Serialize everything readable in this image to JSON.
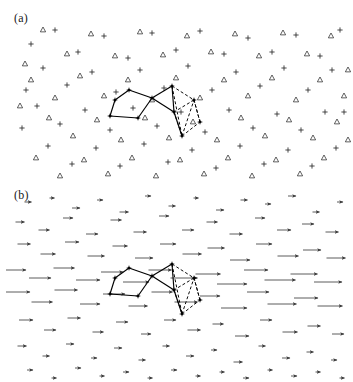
{
  "figure": {
    "type": "two-panel-scientific-figure",
    "width": 353,
    "height": 382,
    "background": "#ffffff"
  },
  "panels": [
    {
      "id": "a",
      "label": "(a)",
      "description": "Disordered two-dimensional particle lattice rendered with two alternating point-marker species (plus crosses and open upward triangles), overlaid by a bonded cluster: a solid pentagon on the left joined to a solid triangle, with dashed rhombus bonds on the right.",
      "marker_types": [
        "plus",
        "triangle"
      ],
      "marker_color": "#2b2b2b",
      "overlay_solid_color": "#000000",
      "overlay_dashed_color": "#000000",
      "n_markers": 120
    },
    {
      "id": "b",
      "label": "(b)",
      "description": "Same spatial domain shown as a displacement vector field: every lattice site carries a rightward-pointing arrow whose length encodes the local displacement magnitude, largest through the central horizontal band. The identical bonded cluster from panel (a) is overlaid.",
      "arrow_direction": "right",
      "arrow_color": "#4a4a4a",
      "arrowhead_color": "#3a3a3a",
      "n_arrows": 120
    }
  ],
  "chart_data": {
    "type": "scatter",
    "title": "",
    "subtitle": "",
    "xlabel": "",
    "ylabel": "",
    "grid": false,
    "legend_position": "none",
    "axis_visible": false,
    "tick_labels": [],
    "annotations": [
      "(a)",
      "(b)"
    ],
    "panel_a": {
      "type": "scatter",
      "series": [
        {
          "name": "plus-sites",
          "marker": "plus",
          "points": [
            [
              31,
              44
            ],
            [
              55,
              30
            ],
            [
              78,
              52
            ],
            [
              104,
              36
            ],
            [
              128,
              58
            ],
            [
              152,
              33
            ],
            [
              176,
              50
            ],
            [
              200,
              31
            ],
            [
              224,
              54
            ],
            [
              248,
              38
            ],
            [
              272,
              52
            ],
            [
              296,
              35
            ],
            [
              320,
              56
            ],
            [
              43,
              68
            ],
            [
              67,
              85
            ],
            [
              92,
              72
            ],
            [
              116,
              92
            ],
            [
              140,
              70
            ],
            [
              164,
              88
            ],
            [
              188,
              66
            ],
            [
              212,
              90
            ],
            [
              236,
              72
            ],
            [
              260,
              86
            ],
            [
              284,
              68
            ],
            [
              308,
              90
            ],
            [
              332,
              70
            ],
            [
              37,
              106
            ],
            [
              60,
              124
            ],
            [
              85,
              110
            ],
            [
              110,
              130
            ],
            [
              133,
              108
            ],
            [
              157,
              126
            ],
            [
              181,
              112
            ],
            [
              205,
              132
            ],
            [
              229,
              110
            ],
            [
              253,
              128
            ],
            [
              277,
              114
            ],
            [
              301,
              130
            ],
            [
              325,
              112
            ],
            [
              48,
              146
            ],
            [
              72,
              164
            ],
            [
              96,
              148
            ],
            [
              120,
              166
            ],
            [
              144,
              144
            ],
            [
              168,
              162
            ],
            [
              192,
              150
            ],
            [
              216,
              168
            ],
            [
              240,
              146
            ],
            [
              264,
              164
            ],
            [
              288,
              150
            ],
            [
              312,
              166
            ],
            [
              336,
              148
            ],
            [
              26,
              90
            ],
            [
              340,
              30
            ],
            [
              22,
              128
            ],
            [
              344,
              112
            ]
          ]
        },
        {
          "name": "triangle-sites",
          "marker": "triangle",
          "points": [
            [
              43,
              30
            ],
            [
              67,
              54
            ],
            [
              91,
              34
            ],
            [
              115,
              56
            ],
            [
              140,
              32
            ],
            [
              163,
              55
            ],
            [
              187,
              36
            ],
            [
              211,
              52
            ],
            [
              235,
              34
            ],
            [
              259,
              56
            ],
            [
              283,
              33
            ],
            [
              307,
              54
            ],
            [
              331,
              36
            ],
            [
              31,
              80
            ],
            [
              55,
              98
            ],
            [
              80,
              76
            ],
            [
              104,
              96
            ],
            [
              128,
              80
            ],
            [
              152,
              100
            ],
            [
              176,
              78
            ],
            [
              200,
              98
            ],
            [
              224,
              80
            ],
            [
              248,
              96
            ],
            [
              272,
              78
            ],
            [
              296,
              100
            ],
            [
              320,
              80
            ],
            [
              344,
              96
            ],
            [
              25,
              64
            ],
            [
              49,
              118
            ],
            [
              73,
              136
            ],
            [
              97,
              120
            ],
            [
              121,
              140
            ],
            [
              145,
              118
            ],
            [
              169,
              138
            ],
            [
              193,
              122
            ],
            [
              217,
              140
            ],
            [
              241,
              118
            ],
            [
              265,
              136
            ],
            [
              289,
              120
            ],
            [
              313,
              138
            ],
            [
              337,
              122
            ],
            [
              36,
              158
            ],
            [
              60,
              176
            ],
            [
              84,
              160
            ],
            [
              108,
              174
            ],
            [
              132,
              158
            ],
            [
              156,
              176
            ],
            [
              180,
              160
            ],
            [
              204,
              174
            ],
            [
              228,
              158
            ],
            [
              252,
              176
            ],
            [
              276,
              160
            ],
            [
              300,
              174
            ],
            [
              324,
              158
            ],
            [
              348,
              70
            ],
            [
              20,
              106
            ],
            [
              348,
              140
            ]
          ]
        }
      ]
    },
    "panel_b": {
      "type": "quiver",
      "description": "Rightward displacement arrows; length proportional to magnitude.",
      "magnitude_profile": "peaks in the central horizontal band, decays toward top and bottom edges",
      "min_length_px": 5,
      "max_length_px": 34,
      "arrows": [
        [
          28,
          16,
          7
        ],
        [
          52,
          12,
          5
        ],
        [
          76,
          22,
          8
        ],
        [
          100,
          14,
          6
        ],
        [
          124,
          26,
          9
        ],
        [
          148,
          10,
          6
        ],
        [
          172,
          20,
          7
        ],
        [
          196,
          12,
          5
        ],
        [
          220,
          24,
          8
        ],
        [
          244,
          14,
          7
        ],
        [
          268,
          18,
          6
        ],
        [
          292,
          10,
          8
        ],
        [
          316,
          26,
          7
        ],
        [
          340,
          16,
          6
        ],
        [
          20,
          36,
          9
        ],
        [
          44,
          44,
          11
        ],
        [
          68,
          32,
          10
        ],
        [
          92,
          48,
          12
        ],
        [
          116,
          34,
          11
        ],
        [
          140,
          46,
          13
        ],
        [
          164,
          30,
          10
        ],
        [
          188,
          44,
          12
        ],
        [
          212,
          36,
          11
        ],
        [
          236,
          48,
          13
        ],
        [
          260,
          32,
          10
        ],
        [
          284,
          44,
          14
        ],
        [
          308,
          38,
          12
        ],
        [
          332,
          46,
          13
        ],
        [
          24,
          58,
          13
        ],
        [
          48,
          68,
          15
        ],
        [
          72,
          56,
          14
        ],
        [
          96,
          70,
          17
        ],
        [
          120,
          60,
          15
        ],
        [
          144,
          72,
          18
        ],
        [
          168,
          58,
          16
        ],
        [
          192,
          68,
          19
        ],
        [
          216,
          62,
          17
        ],
        [
          240,
          74,
          20
        ],
        [
          264,
          58,
          16
        ],
        [
          288,
          70,
          21
        ],
        [
          312,
          64,
          18
        ],
        [
          336,
          72,
          19
        ],
        [
          16,
          84,
          20
        ],
        [
          40,
          92,
          22
        ],
        [
          64,
          82,
          21
        ],
        [
          88,
          94,
          24
        ],
        [
          112,
          86,
          22
        ],
        [
          136,
          96,
          26
        ],
        [
          160,
          84,
          23
        ],
        [
          184,
          92,
          27
        ],
        [
          208,
          88,
          25
        ],
        [
          232,
          98,
          30
        ],
        [
          256,
          84,
          24
        ],
        [
          280,
          94,
          31
        ],
        [
          304,
          88,
          27
        ],
        [
          328,
          96,
          28
        ],
        [
          18,
          106,
          24
        ],
        [
          42,
          116,
          21
        ],
        [
          66,
          104,
          23
        ],
        [
          90,
          118,
          20
        ],
        [
          114,
          108,
          22
        ],
        [
          138,
          120,
          19
        ],
        [
          162,
          106,
          21
        ],
        [
          186,
          116,
          23
        ],
        [
          210,
          110,
          20
        ],
        [
          234,
          122,
          26
        ],
        [
          258,
          106,
          22
        ],
        [
          282,
          118,
          29
        ],
        [
          306,
          112,
          24
        ],
        [
          330,
          120,
          25
        ],
        [
          26,
          134,
          14
        ],
        [
          50,
          144,
          12
        ],
        [
          74,
          132,
          13
        ],
        [
          98,
          146,
          11
        ],
        [
          122,
          136,
          12
        ],
        [
          146,
          148,
          10
        ],
        [
          170,
          134,
          12
        ],
        [
          194,
          144,
          13
        ],
        [
          218,
          138,
          11
        ],
        [
          242,
          150,
          14
        ],
        [
          266,
          134,
          12
        ],
        [
          290,
          146,
          15
        ],
        [
          314,
          140,
          13
        ],
        [
          338,
          148,
          12
        ],
        [
          22,
          160,
          9
        ],
        [
          46,
          170,
          7
        ],
        [
          70,
          158,
          8
        ],
        [
          94,
          172,
          6
        ],
        [
          118,
          162,
          8
        ],
        [
          142,
          174,
          7
        ],
        [
          166,
          160,
          7
        ],
        [
          190,
          170,
          8
        ],
        [
          214,
          164,
          6
        ],
        [
          238,
          176,
          9
        ],
        [
          262,
          160,
          7
        ],
        [
          286,
          172,
          8
        ],
        [
          310,
          166,
          7
        ],
        [
          334,
          174,
          6
        ],
        [
          30,
          184,
          6
        ],
        [
          54,
          192,
          5
        ],
        [
          78,
          182,
          6
        ],
        [
          102,
          190,
          5
        ],
        [
          126,
          186,
          6
        ],
        [
          150,
          192,
          5
        ],
        [
          174,
          184,
          6
        ],
        [
          198,
          190,
          5
        ],
        [
          222,
          186,
          5
        ],
        [
          246,
          192,
          6
        ],
        [
          270,
          184,
          5
        ],
        [
          294,
          190,
          6
        ],
        [
          318,
          186,
          5
        ],
        [
          342,
          192,
          5
        ]
      ]
    },
    "overlay_cluster": {
      "description": "Bonded particle cluster identical in both panels: left solid pentagon, central solid triangle/chevron, right dashed rhombi.",
      "vertices": [
        [
          33,
          22
        ],
        [
          47,
          12
        ],
        [
          70,
          20
        ],
        [
          56,
          40
        ],
        [
          28,
          38
        ],
        [
          90,
          8
        ],
        [
          92,
          34
        ],
        [
          112,
          22
        ],
        [
          118,
          44
        ],
        [
          100,
          58
        ]
      ],
      "solid_edges": [
        [
          [
            33,
            22
          ],
          [
            47,
            12
          ]
        ],
        [
          [
            47,
            12
          ],
          [
            70,
            20
          ]
        ],
        [
          [
            70,
            20
          ],
          [
            56,
            40
          ]
        ],
        [
          [
            56,
            40
          ],
          [
            28,
            38
          ]
        ],
        [
          [
            28,
            38
          ],
          [
            33,
            22
          ]
        ],
        [
          [
            70,
            20
          ],
          [
            90,
            8
          ]
        ],
        [
          [
            90,
            8
          ],
          [
            92,
            34
          ]
        ],
        [
          [
            92,
            34
          ],
          [
            70,
            20
          ]
        ],
        [
          [
            92,
            34
          ],
          [
            100,
            58
          ]
        ]
      ],
      "dashed_edges": [
        [
          [
            90,
            8
          ],
          [
            112,
            22
          ]
        ],
        [
          [
            112,
            22
          ],
          [
            92,
            34
          ]
        ],
        [
          [
            92,
            34
          ],
          [
            100,
            58
          ]
        ],
        [
          [
            100,
            58
          ],
          [
            118,
            44
          ]
        ],
        [
          [
            118,
            44
          ],
          [
            112,
            22
          ]
        ],
        [
          [
            112,
            22
          ],
          [
            118,
            44
          ]
        ],
        [
          [
            90,
            8
          ],
          [
            100,
            58
          ]
        ],
        [
          [
            100,
            58
          ],
          [
            112,
            22
          ]
        ]
      ]
    }
  }
}
